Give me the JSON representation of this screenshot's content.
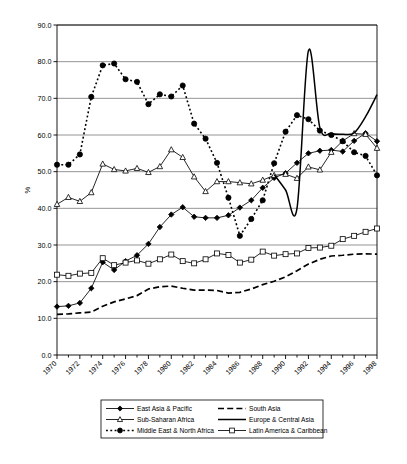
{
  "chart_data": {
    "type": "line",
    "title": "",
    "xlabel": "",
    "ylabel": "%",
    "xlim": [
      1970,
      1998
    ],
    "ylim": [
      0,
      90
    ],
    "ytick_step": 10,
    "yticks": [
      "0.0",
      "10.0",
      "20.0",
      "30.0",
      "40.0",
      "50.0",
      "60.0",
      "70.0",
      "80.0",
      "90.0"
    ],
    "ytick_values": [
      0,
      10,
      20,
      30,
      40,
      50,
      60,
      70,
      80,
      90
    ],
    "x": [
      1970,
      1971,
      1972,
      1973,
      1974,
      1975,
      1976,
      1977,
      1978,
      1979,
      1980,
      1981,
      1982,
      1983,
      1984,
      1985,
      1986,
      1987,
      1988,
      1989,
      1990,
      1991,
      1992,
      1993,
      1994,
      1995,
      1996,
      1997,
      1998
    ],
    "xticks": [
      "1970",
      "1972",
      "1974",
      "1976",
      "1978",
      "1980",
      "1982",
      "1984",
      "1986",
      "1988",
      "1990",
      "1992",
      "1994",
      "1996",
      "1998"
    ],
    "xtick_values": [
      1970,
      1972,
      1974,
      1976,
      1978,
      1980,
      1982,
      1984,
      1986,
      1988,
      1990,
      1992,
      1994,
      1996,
      1998
    ],
    "xtick_minor_every": 1,
    "grid": "horizontal",
    "legend_position": "bottom",
    "series": [
      {
        "name": "East Asia & Pacific",
        "marker": "diamond-filled",
        "line_style": "solid",
        "values": [
          13.2,
          13.4,
          14.2,
          18.2,
          25.3,
          23.2,
          25.6,
          27.2,
          30.3,
          34.9,
          38.3,
          40.3,
          37.7,
          37.4,
          37.4,
          38.1,
          40.2,
          42.2,
          45.6,
          48.3,
          49.6,
          52.4,
          55.0,
          55.7,
          55.9,
          55.5,
          58.4,
          60.5,
          58.3
        ]
      },
      {
        "name": "South Asia",
        "marker": "none",
        "line_style": "dashed",
        "values": [
          11.1,
          11.2,
          11.5,
          11.7,
          13.3,
          14.5,
          15.3,
          16.2,
          18.0,
          18.6,
          18.8,
          18.2,
          17.7,
          17.7,
          17.6,
          16.9,
          17.1,
          18.0,
          19.2,
          20.1,
          21.3,
          23.0,
          24.8,
          26.1,
          27.0,
          27.2,
          27.5,
          27.6,
          27.5
        ]
      },
      {
        "name": "Sub-Saharan Africa",
        "marker": "triangle-open",
        "line_style": "solid",
        "values": [
          41.1,
          43.0,
          41.9,
          44.3,
          52.1,
          50.6,
          50.2,
          50.9,
          49.8,
          51.4,
          56.0,
          53.9,
          48.6,
          44.6,
          47.3,
          47.3,
          47.0,
          46.7,
          47.7,
          49.0,
          49.3,
          48.2,
          51.3,
          50.5,
          55.3,
          58.4,
          60.4,
          60.2,
          56.4
        ]
      },
      {
        "name": "Europe & Central Asia",
        "marker": "none",
        "line_style": "solid-thick",
        "values": [
          null,
          null,
          null,
          null,
          null,
          null,
          null,
          null,
          null,
          null,
          null,
          null,
          null,
          null,
          null,
          null,
          null,
          null,
          null,
          49.2,
          45.0,
          40.0,
          83.0,
          62.0,
          60.4,
          60.2,
          60.6,
          65.0,
          71.0
        ]
      },
      {
        "name": "Middle East & North Africa",
        "marker": "circle-filled",
        "line_style": "dotted",
        "values": [
          51.9,
          51.9,
          54.7,
          70.4,
          79.0,
          79.5,
          75.2,
          74.5,
          68.4,
          71.1,
          70.5,
          73.5,
          63.1,
          59.0,
          52.4,
          42.9,
          32.5,
          37.1,
          42.2,
          52.3,
          60.9,
          65.4,
          64.3,
          61.2,
          60.0,
          58.3,
          55.3,
          54.3,
          49.0
        ]
      },
      {
        "name": "Latin America & Caribbean",
        "marker": "square-open",
        "line_style": "solid",
        "values": [
          21.9,
          21.6,
          22.2,
          22.4,
          26.4,
          24.5,
          25.2,
          25.8,
          24.9,
          26.1,
          27.4,
          25.6,
          25.0,
          26.1,
          27.7,
          27.3,
          25.2,
          26.0,
          28.2,
          27.1,
          27.5,
          27.7,
          29.2,
          29.3,
          29.8,
          31.6,
          32.5,
          33.6,
          34.5
        ]
      }
    ]
  },
  "legend": {
    "items": [
      {
        "label": "East Asia & Pacific",
        "key": "east-asia-pacific"
      },
      {
        "label": "South Asia",
        "key": "south-asia"
      },
      {
        "label": "Sub-Saharan Africa",
        "key": "sub-saharan-africa"
      },
      {
        "label": "Europe & Central Asia",
        "key": "europe-central-asia"
      },
      {
        "label": "Middle East & North Africa",
        "key": "middle-east-north-africa"
      },
      {
        "label": "Latin America & Caribbean",
        "key": "latin-america-caribbean"
      }
    ]
  },
  "colors": {
    "ink": "#000000",
    "grid": "#7a7a7a",
    "background": "#ffffff"
  }
}
